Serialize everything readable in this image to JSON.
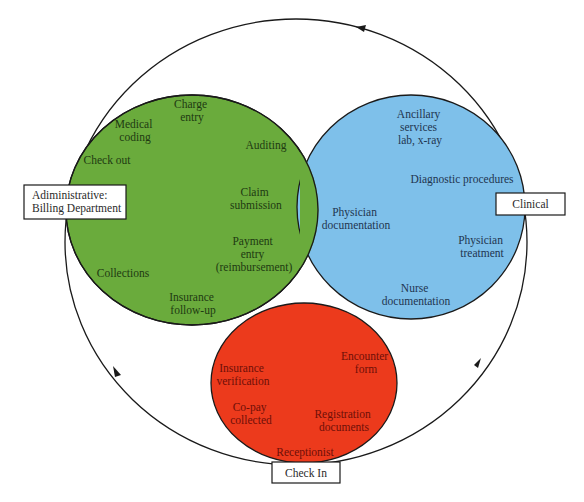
{
  "colors": {
    "administrative": "#6aab3c",
    "clinical": "#7ec0ea",
    "check_in": "#ec3a1c",
    "administrative_text": "#1e3a12",
    "clinical_text": "#1f3550",
    "check_in_text": "#6e0f08",
    "outline": "#1a1a1a"
  },
  "boxes": {
    "administrative": [
      "Adiministrative:",
      "Billing Department"
    ],
    "clinical": "Clinical",
    "check_in": "Check In"
  },
  "administrative": {
    "items": [
      {
        "lines": [
          "Charge",
          "entry"
        ]
      },
      {
        "lines": [
          "Medical",
          "coding"
        ]
      },
      {
        "lines": [
          "Check out"
        ]
      },
      {
        "lines": [
          "Auditing"
        ]
      },
      {
        "lines": [
          "Claim",
          "submission"
        ]
      },
      {
        "lines": [
          "Payment",
          "entry",
          "(reimbursement)"
        ]
      },
      {
        "lines": [
          "Collections"
        ]
      },
      {
        "lines": [
          "Insurance",
          "follow-up"
        ]
      }
    ]
  },
  "clinical": {
    "items": [
      {
        "lines": [
          "Ancillary",
          "services",
          "lab, x-ray"
        ]
      },
      {
        "lines": [
          "Diagnostic procedures"
        ]
      },
      {
        "lines": [
          "Physician",
          "documentation"
        ]
      },
      {
        "lines": [
          "Physician",
          "treatment"
        ]
      },
      {
        "lines": [
          "Nurse",
          "documentation"
        ]
      }
    ]
  },
  "check_in": {
    "items": [
      {
        "lines": [
          "Insurance",
          "verification"
        ]
      },
      {
        "lines": [
          "Encounter",
          "form"
        ]
      },
      {
        "lines": [
          "Co-pay",
          "collected"
        ]
      },
      {
        "lines": [
          "Registration",
          "documents"
        ]
      },
      {
        "lines": [
          "Receptionist"
        ]
      }
    ]
  }
}
